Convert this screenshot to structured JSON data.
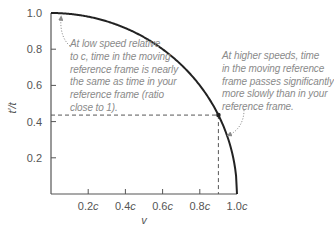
{
  "chart_data": {
    "type": "line",
    "title": "",
    "xlabel": "v",
    "ylabel": "t′/t",
    "xlim": [
      0,
      1.0
    ],
    "ylim": [
      0,
      1.0
    ],
    "grid": false,
    "legend": null,
    "x_ticks": [
      0.2,
      0.4,
      0.6,
      0.8,
      1.0
    ],
    "x_tick_labels": [
      "0.2c",
      "0.4c",
      "0.6c",
      "0.8c",
      "1.0c"
    ],
    "y_ticks": [
      0.2,
      0.4,
      0.6,
      0.8,
      1.0
    ],
    "y_tick_labels": [
      "0.2",
      "0.4",
      "0.6",
      "0.8",
      "1.0"
    ],
    "series": [
      {
        "name": "t′/t = sqrt(1 − v²/c²)",
        "x": [
          0,
          0.1,
          0.2,
          0.3,
          0.4,
          0.5,
          0.6,
          0.7,
          0.8,
          0.85,
          0.9,
          0.95,
          0.98,
          1.0
        ],
        "y": [
          1.0,
          0.995,
          0.98,
          0.954,
          0.917,
          0.866,
          0.8,
          0.714,
          0.6,
          0.527,
          0.436,
          0.312,
          0.199,
          0.0
        ]
      }
    ],
    "highlight_point": {
      "x": 0.9,
      "y": 0.436
    },
    "annotations": [
      {
        "text": "At low speed relative\nto c, time in the moving\nreference frame is nearly\nthe same as time in your\nreference frame (ratio\nclose to 1).",
        "points_to": {
          "x": 0.05,
          "y": 1.0
        }
      },
      {
        "text": "At higher speeds, time\nin the moving reference\nframe passes significantly\nmore slowly than in your\nreference frame.",
        "points_to": {
          "x": 0.93,
          "y": 0.32
        }
      }
    ]
  },
  "colors": {
    "curve": "#222222",
    "axis": "#555555",
    "annotation_text": "#8a8a8a",
    "dashed": "#444444"
  }
}
